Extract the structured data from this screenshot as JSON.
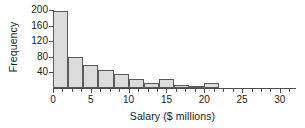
{
  "chart_data": {
    "type": "bar",
    "title": "",
    "subtitle": "",
    "xlabel": "Salary ($ millions)",
    "ylabel": "Frequency",
    "grid": false,
    "legend": null,
    "bin_width": 2,
    "xlim": [
      0,
      32
    ],
    "ylim": [
      0,
      200
    ],
    "yticks": [
      40,
      80,
      120,
      160,
      200
    ],
    "xticks_major": [
      0,
      5,
      10,
      15,
      20,
      25,
      30
    ],
    "xticks_minor": [
      1.25,
      2.5,
      3.75,
      6.25,
      7.5,
      8.75,
      11.25,
      12.5,
      13.75,
      16.25,
      17.5,
      18.75,
      21.25,
      22.5,
      23.75,
      26.25,
      27.5,
      28.75,
      31.25
    ],
    "bins": [
      {
        "x0": 0,
        "x1": 2,
        "value": 197
      },
      {
        "x0": 2,
        "x1": 4,
        "value": 80
      },
      {
        "x0": 4,
        "x1": 6,
        "value": 58
      },
      {
        "x0": 6,
        "x1": 8,
        "value": 45
      },
      {
        "x0": 8,
        "x1": 10,
        "value": 36
      },
      {
        "x0": 10,
        "x1": 12,
        "value": 22
      },
      {
        "x0": 12,
        "x1": 14,
        "value": 12
      },
      {
        "x0": 14,
        "x1": 16,
        "value": 22
      },
      {
        "x0": 16,
        "x1": 18,
        "value": 7
      },
      {
        "x0": 18,
        "x1": 20,
        "value": 3
      },
      {
        "x0": 20,
        "x1": 22,
        "value": 14
      }
    ],
    "categories": [
      "0-2",
      "2-4",
      "4-6",
      "6-8",
      "8-10",
      "10-12",
      "12-14",
      "14-16",
      "16-18",
      "18-20",
      "20-22"
    ],
    "values": [
      197,
      80,
      58,
      45,
      36,
      22,
      12,
      22,
      7,
      3,
      14
    ],
    "colors": {
      "bar_fill": "#dcdcdc",
      "bar_stroke": "#5a5a5a",
      "axis": "#4d4d4d",
      "text": "#1a1a1a",
      "background": "#ffffff"
    }
  }
}
